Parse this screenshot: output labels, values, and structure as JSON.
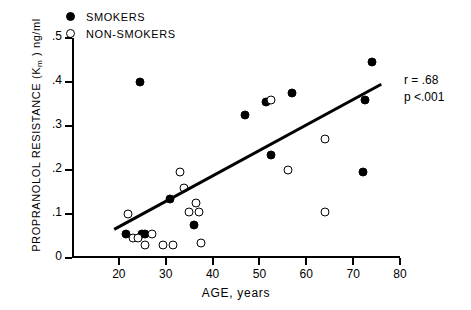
{
  "legend": {
    "items": [
      {
        "label": "SMOKERS",
        "marker": "filled-circle"
      },
      {
        "label": "NON-SMOKERS",
        "marker": "open-circle"
      }
    ]
  },
  "annotations": {
    "r_text": "r = .68",
    "p_text": "p <.001"
  },
  "chart_data": {
    "type": "scatter",
    "title": "",
    "xlabel": "AGE, years",
    "ylabel": "PROPRANOLOL RESISTANCE (Km ) ng/ml",
    "ylabel_main": "PROPRANOLOL  RESISTANCE  (K",
    "ylabel_sub": "m",
    "ylabel_tail": " ) ng/ml",
    "xlim": [
      10,
      80
    ],
    "ylim": [
      0,
      0.5
    ],
    "grid": false,
    "legend_position": "top-left",
    "xticks": [
      20,
      30,
      40,
      50,
      60,
      70,
      80
    ],
    "xtick_labels": [
      "20",
      "30",
      "40",
      "50",
      "60",
      "70",
      "80"
    ],
    "yticks": [
      0,
      0.1,
      0.2,
      0.3,
      0.4,
      0.5
    ],
    "ytick_labels": [
      "0",
      ".1",
      ".2",
      ".3",
      ".4",
      ".5"
    ],
    "series": [
      {
        "name": "SMOKERS",
        "marker": "filled-circle",
        "points": [
          [
            21.5,
            0.055
          ],
          [
            24.5,
            0.4
          ],
          [
            25.0,
            0.055
          ],
          [
            25.6,
            0.055
          ],
          [
            31.0,
            0.135
          ],
          [
            36.0,
            0.075
          ],
          [
            47.0,
            0.325
          ],
          [
            51.5,
            0.355
          ],
          [
            52.5,
            0.235
          ],
          [
            57.0,
            0.375
          ],
          [
            72.0,
            0.195
          ],
          [
            72.5,
            0.36
          ],
          [
            74.0,
            0.445
          ]
        ]
      },
      {
        "name": "NON-SMOKERS",
        "marker": "open-circle",
        "points": [
          [
            22.0,
            0.1
          ],
          [
            23.0,
            0.045
          ],
          [
            24.0,
            0.045
          ],
          [
            25.5,
            0.03
          ],
          [
            27.0,
            0.055
          ],
          [
            29.5,
            0.03
          ],
          [
            31.5,
            0.03
          ],
          [
            33.0,
            0.195
          ],
          [
            34.0,
            0.16
          ],
          [
            35.0,
            0.105
          ],
          [
            36.5,
            0.125
          ],
          [
            37.0,
            0.105
          ],
          [
            37.5,
            0.035
          ],
          [
            52.5,
            0.36
          ],
          [
            56.0,
            0.2
          ],
          [
            64.0,
            0.27
          ],
          [
            64.0,
            0.105
          ]
        ]
      }
    ],
    "fit_line": {
      "x": [
        19.0,
        76.0
      ],
      "y": [
        0.065,
        0.395
      ],
      "r": 0.68,
      "p": "<.001"
    }
  }
}
